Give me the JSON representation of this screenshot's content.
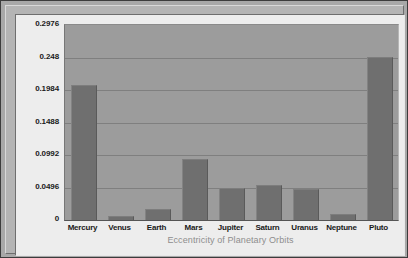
{
  "chart_data": {
    "type": "bar",
    "title": "",
    "xlabel": "Eccentricity of Planetary Orbits",
    "ylabel": "",
    "categories": [
      "Mercury",
      "Venus",
      "Earth",
      "Mars",
      "Jupiter",
      "Saturn",
      "Uranus",
      "Neptune",
      "Pluto"
    ],
    "values": [
      0.2056,
      0.0068,
      0.0167,
      0.0934,
      0.0484,
      0.0542,
      0.0472,
      0.0086,
      0.2488
    ],
    "ylim": [
      0,
      0.2976
    ],
    "yticks": [
      0,
      0.0496,
      0.0992,
      0.1488,
      0.1984,
      0.248,
      0.2976
    ],
    "ytick_labels": [
      "0",
      "0.0496",
      "0.0992",
      "0.1488",
      "0.1984",
      "0.248",
      "0.2976"
    ],
    "grid": true,
    "legend": false,
    "colors": {
      "bar": "#6f6f6f",
      "plot_background": "#9c9c9c",
      "canvas_background": "#ededed",
      "frame": "#b4b4b4",
      "gridline": "#7f7f7f",
      "tick_text": "#1a1a1a",
      "axis_title_text": "#8e8e8e"
    }
  }
}
